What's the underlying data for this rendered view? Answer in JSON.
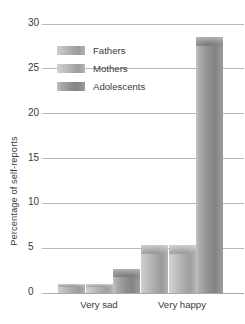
{
  "chart_data": {
    "type": "bar",
    "title": "",
    "xlabel": "",
    "ylabel": "Percentage of self-reports",
    "categories": [
      "Very sad",
      "Very happy"
    ],
    "series": [
      {
        "name": "Fathers",
        "values": [
          1.0,
          5.4
        ]
      },
      {
        "name": "Mothers",
        "values": [
          1.0,
          5.4
        ]
      },
      {
        "name": "Adolescents",
        "values": [
          2.7,
          28.6
        ]
      }
    ],
    "ylim": [
      0,
      30
    ],
    "yticks": [
      0,
      5,
      10,
      15,
      20,
      25,
      30
    ],
    "ytick_labels": [
      "0",
      "5",
      "10",
      "15",
      "20",
      "25",
      "30"
    ],
    "grid": true,
    "legend_position": "upper-left-inside",
    "colors": {
      "fathers": "#b4b4b4",
      "mothers": "#b8b8b8",
      "adolescents": "#919191",
      "gridline": "#b9b9b9",
      "text": "#3a3a3a",
      "background": "#ffffff"
    }
  }
}
